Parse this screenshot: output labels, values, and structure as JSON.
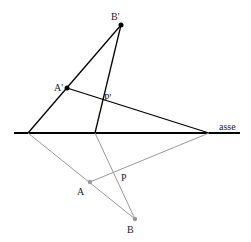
{
  "diagram": {
    "axis_label": "asse",
    "points": {
      "B_prime": {
        "label": "B'",
        "x": 121,
        "y": 25
      },
      "A_prime": {
        "label": "A'",
        "x": 67,
        "y": 88
      },
      "P_prime": {
        "label": "P'"
      },
      "A": {
        "label": "A",
        "x": 90,
        "y": 182
      },
      "B": {
        "label": "B",
        "x": 135,
        "y": 219
      },
      "P": {
        "label": "P"
      }
    },
    "colors": {
      "primary": "#000000",
      "secondary": "#999999"
    }
  }
}
